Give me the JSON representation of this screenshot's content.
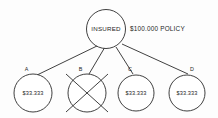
{
  "diagram": {
    "type": "tree",
    "root": {
      "label": "INSURED",
      "annotation": "$100.000 POLICY"
    },
    "beneficiaries": [
      {
        "letter": "A",
        "amount": "$33.333",
        "status": "active"
      },
      {
        "letter": "B",
        "amount": "",
        "status": "crossed-out"
      },
      {
        "letter": "C",
        "amount": "$33.333",
        "status": "active"
      },
      {
        "letter": "D",
        "amount": "$33.333",
        "status": "active"
      }
    ],
    "colors": {
      "stroke": "#2b2b2b",
      "background": "#fdfdfd",
      "text": "#1e1e1e"
    }
  }
}
